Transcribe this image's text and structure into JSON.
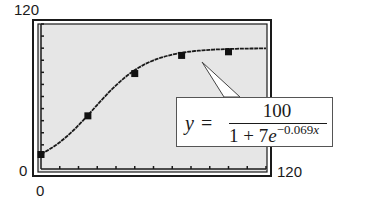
{
  "chart_data": {
    "type": "line",
    "title": "",
    "xlabel": "",
    "ylabel": "",
    "xlim": [
      0,
      120
    ],
    "ylim": [
      0,
      120
    ],
    "x_tick_labels": {
      "min": "0",
      "max": "120"
    },
    "y_tick_labels": {
      "min": "0",
      "max": "120"
    },
    "x_tick_spacing": 10,
    "y_tick_spacing": 10,
    "grid": false,
    "series": [
      {
        "name": "logistic model curve",
        "style": "line",
        "equation": "y = 100 / (1 + 7e^(-0.069x))",
        "x": [
          0,
          10,
          20,
          30,
          40,
          50,
          60,
          70,
          80,
          90,
          100,
          110,
          120
        ],
        "values": [
          12.5,
          22.3,
          36.0,
          52.3,
          67.9,
          80.0,
          88.5,
          93.8,
          96.8,
          98.2,
          99.3,
          99.6,
          99.8
        ]
      },
      {
        "name": "data points",
        "style": "scatter",
        "marker": "square",
        "x": [
          0,
          25,
          50,
          75,
          100
        ],
        "values": [
          12,
          44,
          79,
          94,
          97
        ]
      }
    ],
    "annotations": [
      {
        "type": "callout",
        "text": "y = 100 / (1 + 7e^(-0.069x))",
        "points_to_x": 85
      }
    ]
  },
  "axes": {
    "y_max_label": "120",
    "y_min_label": "0",
    "x_min_label": "0",
    "x_max_label": "120"
  },
  "formula": {
    "lhs": "y",
    "equals": "=",
    "numerator": "100",
    "den_prefix": "1 + 7",
    "den_e": "e",
    "exp_prefix": "−0.069",
    "exp_var": "x"
  },
  "colors": {
    "plot_background": "#e6e6e6",
    "frame": "#1a1a1a",
    "curve": "#1a1a1a",
    "marker": "#111111"
  }
}
